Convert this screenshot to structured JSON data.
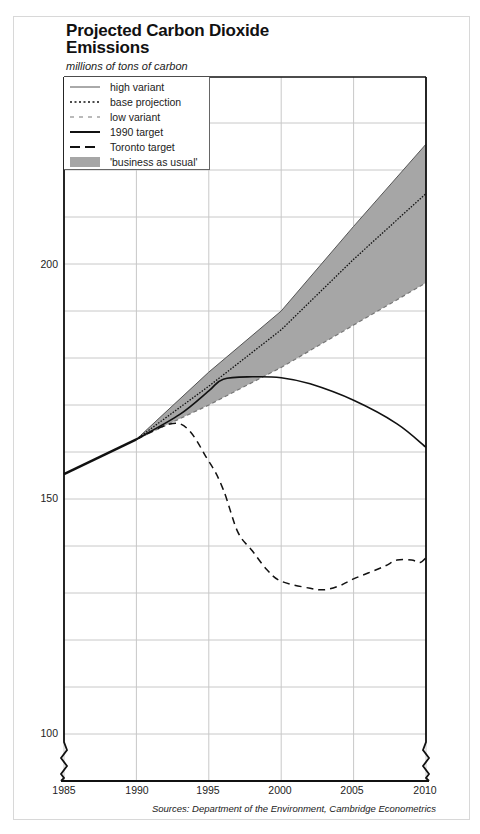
{
  "header": {
    "title": "Projected Carbon Dioxide Emissions",
    "title_line1": "Projected Carbon Dioxide",
    "title_line2": "Emissions",
    "subtitle": "millions of tons of carbon"
  },
  "legend": {
    "items": [
      {
        "label": "high variant",
        "style": "thin-solid"
      },
      {
        "label": "base projection",
        "style": "dotted"
      },
      {
        "label": "low variant",
        "style": "dashed-grey"
      },
      {
        "label": "1990 target",
        "style": "thick-solid"
      },
      {
        "label": "Toronto target",
        "style": "long-dash"
      },
      {
        "label": "'business as usual'",
        "style": "grey-fill"
      }
    ]
  },
  "axes": {
    "y_ticks": [
      "200",
      "150",
      "100"
    ],
    "x_ticks": [
      "1985",
      "1990",
      "1995",
      "2000",
      "2005",
      "2010"
    ]
  },
  "footer": {
    "source": "Sources: Department of the Environment, Cambridge Econometrics"
  },
  "colors": {
    "band_fill": "#a6a6a6",
    "line": "#111111",
    "grid": "#c8c8c8"
  },
  "chart_data": {
    "type": "line",
    "title": "Projected Carbon Dioxide Emissions",
    "subtitle": "millions of tons of carbon",
    "xlabel": "",
    "ylabel": "millions of tons of carbon",
    "xlim": [
      1985,
      2010
    ],
    "ylim": [
      90,
      240
    ],
    "y_axis_break": true,
    "grid": true,
    "legend_position": "top-left",
    "x_ticks": [
      1985,
      1990,
      1995,
      2000,
      2005,
      2010
    ],
    "y_ticks": [
      100,
      150,
      200
    ],
    "series": [
      {
        "name": "historical",
        "x": [
          1985,
          1990
        ],
        "values": [
          155.3,
          162.7
        ]
      },
      {
        "name": "high variant",
        "x": [
          1990,
          1995,
          2000,
          2005,
          2010
        ],
        "values": [
          162.7,
          177,
          190,
          208,
          225.5
        ]
      },
      {
        "name": "base projection",
        "x": [
          1990,
          1995,
          2000,
          2005,
          2010
        ],
        "values": [
          162.7,
          174,
          186,
          201,
          215
        ]
      },
      {
        "name": "low variant",
        "x": [
          1990,
          1995,
          2000,
          2005,
          2010
        ],
        "values": [
          162.7,
          170,
          178,
          187,
          196
        ]
      },
      {
        "name": "1990 target",
        "x": [
          1990,
          1993,
          1995,
          1996,
          1998,
          2000,
          2002,
          2005,
          2008,
          2010
        ],
        "values": [
          162.7,
          168,
          173,
          175.5,
          176,
          175.8,
          174.5,
          171,
          166,
          161
        ]
      },
      {
        "name": "Toronto target",
        "x": [
          1990,
          1993,
          1995,
          1996,
          1997,
          1998,
          1999,
          2000,
          2002,
          2003,
          2004,
          2005,
          2007,
          2008,
          2009,
          2009.6,
          2010
        ],
        "values": [
          162.7,
          166,
          158,
          152,
          143,
          139,
          135,
          132.5,
          131,
          130.7,
          131.5,
          133,
          135.5,
          137,
          137,
          136.5,
          137.5
        ]
      },
      {
        "name": "'business as usual'",
        "type": "area-band",
        "x": [
          1990,
          1995,
          2000,
          2005,
          2010
        ],
        "upper": [
          162.7,
          177,
          190,
          208,
          225.5
        ],
        "lower": [
          162.7,
          170,
          178,
          187,
          196
        ]
      }
    ]
  }
}
